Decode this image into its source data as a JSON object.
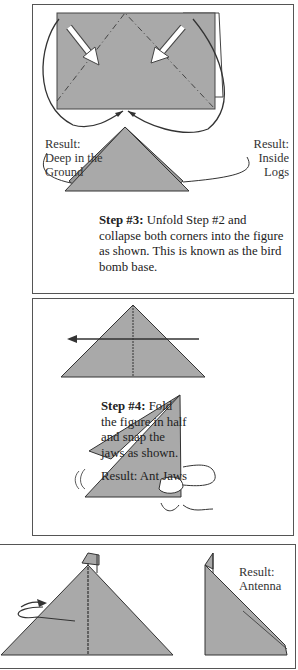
{
  "left_column": {
    "para1": [
      "uge",
      "zed",
      "eep",
      "side",
      "rate",
      "rner",
      "ond"
    ],
    "para2": [
      "as a",
      "that",
      "ody",
      "and",
      "r of",
      "with"
    ],
    "para3": [
      "nae",
      "hich",
      "and",
      "with"
    ],
    "para4": [
      "d, it",
      "that",
      "ony",
      "ony",
      "l so",
      "out"
    ]
  },
  "step3": {
    "result_left": [
      "Result:",
      "Deep in the",
      "Ground"
    ],
    "result_right": [
      "Result:",
      "Inside",
      "Logs"
    ],
    "caption_bold": "Step #3:",
    "caption_text": " Unfold Step #2 and collapse both corners into the figure as shown. This is known as the bird bomb base."
  },
  "step4": {
    "caption_bold": "Step #4:",
    "caption_lines": [
      " Fold",
      "the figure in half",
      "and snap the",
      "jaws as shown."
    ],
    "result": "Result: Ant Jaws"
  },
  "step5": {
    "result": [
      "Result:",
      "Antenna"
    ]
  },
  "colors": {
    "paper_gray": "#a9a9a9",
    "border": "#555555",
    "ink": "#222222"
  }
}
